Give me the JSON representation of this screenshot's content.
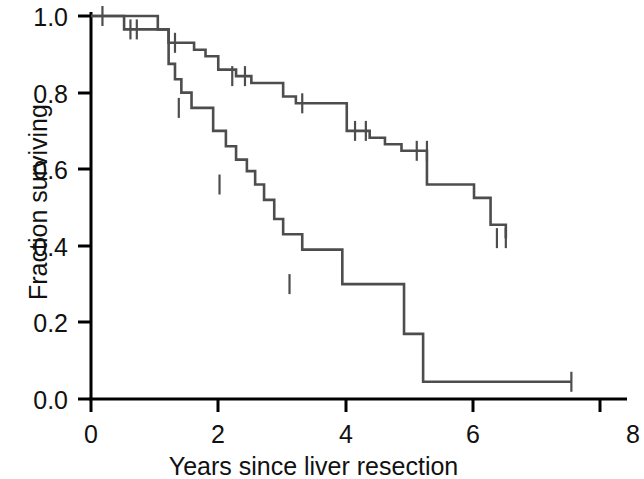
{
  "chart_data": {
    "type": "line",
    "title": "",
    "subtitle": "",
    "xlabel": "Years since liver resection",
    "ylabel": "Fraction surviving",
    "xlim": [
      0,
      8
    ],
    "ylim": [
      0,
      1
    ],
    "xticks": [
      0,
      2,
      4,
      6,
      8
    ],
    "xticklabels": [
      "0",
      "2",
      "4",
      "6",
      "8"
    ],
    "yticks": [
      0.0,
      0.2,
      0.4,
      0.6,
      0.8,
      1.0
    ],
    "yticklabels": [
      "0.0",
      "0.2",
      "0.4",
      "0.6",
      "0.8",
      "1.0"
    ],
    "grid": false,
    "legend": "none",
    "line_color": "#4d4d4d",
    "axis_color": "#000000",
    "plot_style": "kaplan-meier step survival curves, two groups, with censoring tick marks",
    "series": [
      {
        "name": "upper-survival-curve",
        "step": "post",
        "x": [
          0.0,
          0.52,
          1.0,
          1.22,
          1.4,
          1.62,
          1.8,
          2.0,
          2.28,
          2.52,
          2.72,
          3.02,
          3.22,
          3.52,
          4.02,
          4.38,
          4.62,
          4.88,
          5.02,
          5.28,
          6.02,
          6.28,
          6.52
        ],
        "y": [
          1.0,
          0.965,
          0.965,
          0.93,
          0.93,
          0.912,
          0.895,
          0.86,
          0.843,
          0.825,
          0.825,
          0.79,
          0.772,
          0.772,
          0.7,
          0.682,
          0.665,
          0.648,
          0.648,
          0.56,
          0.525,
          0.455,
          0.42
        ],
        "censored_x": [
          0.18,
          0.62,
          0.72,
          1.32,
          2.22,
          2.42,
          3.32,
          4.15,
          4.32,
          5.12,
          5.28,
          6.38,
          6.52
        ],
        "censored_y": [
          1.0,
          0.965,
          0.965,
          0.93,
          0.843,
          0.843,
          0.772,
          0.7,
          0.7,
          0.648,
          0.648,
          0.42,
          0.42
        ]
      },
      {
        "name": "lower-survival-curve",
        "step": "post",
        "x": [
          0.0,
          1.05,
          1.22,
          1.32,
          1.42,
          1.58,
          1.92,
          2.12,
          2.28,
          2.45,
          2.58,
          2.72,
          2.88,
          3.02,
          3.32,
          3.95,
          4.92,
          5.22
        ],
        "y": [
          1.0,
          0.965,
          0.875,
          0.835,
          0.8,
          0.76,
          0.7,
          0.66,
          0.625,
          0.595,
          0.56,
          0.52,
          0.47,
          0.43,
          0.39,
          0.3,
          0.17,
          0.045
        ],
        "censored_x": [
          1.38,
          2.02,
          3.12,
          7.55
        ],
        "censored_y": [
          0.76,
          0.56,
          0.3,
          0.045
        ]
      }
    ]
  },
  "axis_label_x": "Years since liver resection",
  "axis_label_y": "Fraction surviving"
}
